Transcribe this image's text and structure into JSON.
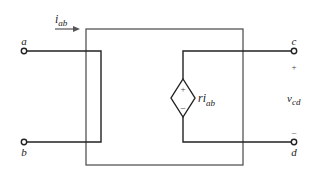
{
  "diagram": {
    "type": "two-port circuit with current-controlled voltage source",
    "terminals": {
      "a": "a",
      "b": "b",
      "c": "c",
      "d": "d"
    },
    "current_label": {
      "main": "i",
      "sub": "ab"
    },
    "source_label": {
      "main": "ri",
      "sub": "ab"
    },
    "source_plus": "+",
    "source_minus": "−",
    "voltage_label": {
      "main": "v",
      "sub": "cd"
    },
    "voltage_plus": "+",
    "voltage_minus": "–",
    "colors": {
      "box": "#555555",
      "wire": "#222222",
      "background": "#ffffff"
    }
  }
}
